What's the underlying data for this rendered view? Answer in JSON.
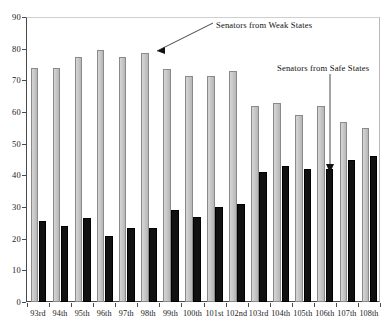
{
  "chart_data": {
    "type": "bar",
    "title": "",
    "xlabel": "",
    "ylabel": "",
    "ylim": [
      0,
      90
    ],
    "ytick_step": 10,
    "yticks": [
      0,
      10,
      20,
      30,
      40,
      50,
      60,
      70,
      80,
      90
    ],
    "grid": false,
    "legend_position": "annotations",
    "categories": [
      "93rd",
      "94th",
      "95th",
      "96th",
      "97th",
      "98th",
      "99th",
      "100th",
      "101st",
      "102nd",
      "103rd",
      "104th",
      "105th",
      "106th",
      "107th",
      "108th"
    ],
    "series": [
      {
        "name": "Senators from Weak States",
        "color": "#c9c9c9",
        "values": [
          74,
          74,
          77.5,
          79.5,
          77.5,
          78.5,
          73.5,
          71.5,
          71.5,
          73,
          62,
          63,
          59,
          62,
          57,
          55
        ]
      },
      {
        "name": "Senators from Safe States",
        "color": "#111111",
        "values": [
          25.5,
          24,
          26.5,
          21,
          23.5,
          23.5,
          29,
          27,
          30,
          31,
          41,
          43,
          42,
          42,
          45,
          46
        ]
      }
    ],
    "annotations": [
      {
        "id": "weak-annotation",
        "text": "Senators from Weak States",
        "points_to_category": "98th",
        "points_to_series": "Senators from Weak States"
      },
      {
        "id": "safe-annotation",
        "text": "Senators from Safe States",
        "points_to_category": "107th",
        "points_to_series": "Senators from Safe States"
      }
    ]
  }
}
